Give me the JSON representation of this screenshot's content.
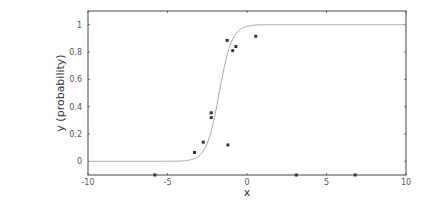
{
  "chart_data": {
    "type": "scatter",
    "title": "",
    "xlabel": "x",
    "ylabel": "y (probability)",
    "xlim": [
      -10,
      10
    ],
    "ylim": [
      -0.1,
      1.1
    ],
    "xticks": [
      -10,
      -5,
      0,
      5,
      10
    ],
    "yticks": [
      0,
      0.2,
      0.4,
      0.6,
      0.8,
      1
    ],
    "xtick_labels": [
      "-10",
      "-5",
      "0",
      "5",
      "10"
    ],
    "ytick_labels": [
      "0",
      "0.2",
      "0.4",
      "0.6",
      "0.8",
      "1"
    ],
    "grid": false,
    "legend": null,
    "series": [
      {
        "name": "observations",
        "kind": "scatter",
        "x": [
          -3.3,
          -2.75,
          -2.25,
          -2.25,
          -1.2,
          -1.25,
          -0.9,
          -0.7,
          0.55,
          -5.8,
          3.1,
          6.8
        ],
        "y": [
          0.065,
          0.14,
          0.355,
          0.32,
          0.12,
          0.885,
          0.81,
          0.84,
          0.915,
          -0.1,
          -0.1,
          -0.1
        ]
      },
      {
        "name": "logistic fit",
        "kind": "line",
        "function": "1/(1+exp(-k*(x-x0)))",
        "k": 2.5,
        "x0": -1.75
      }
    ],
    "colors": {
      "curve": "#9a9a9a",
      "points": "#333333",
      "axes": "#444444"
    }
  }
}
